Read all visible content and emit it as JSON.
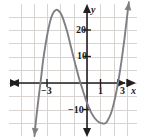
{
  "figure": {
    "kind": "cartesian-graph",
    "background": "#ffffff",
    "grid_color": "#d8d4d2",
    "axis_color": "#231f20",
    "curve_color": "#7f7f86"
  },
  "labels": {
    "y_axis_name": "y",
    "x_axis_name": "x",
    "y_tick_20": "20",
    "y_tick_10": "10",
    "y_tick_neg10": "−10",
    "x_tick_neg3": "−3",
    "x_tick_1": "1",
    "x_tick_3": "3"
  },
  "chart_data": {
    "type": "line",
    "title": "",
    "xlabel": "x",
    "ylabel": "y",
    "xlim": [
      -4.5,
      4.1
    ],
    "ylim": [
      -22,
      32
    ],
    "grid": true,
    "legend": null,
    "x_ticks": [
      -3,
      1,
      3
    ],
    "x_tick_labels": [
      "−3",
      "1",
      "3"
    ],
    "y_ticks": [
      -10,
      10,
      20
    ],
    "y_tick_labels": [
      "−10",
      "10",
      "20"
    ],
    "grid_step_x": 1,
    "grid_step_y": 5,
    "axis_arrows": [
      "left",
      "right",
      "up",
      "down"
    ],
    "series": [
      {
        "name": "cubic",
        "color": "#7f7f86",
        "x": [
          -3.95,
          -3.8,
          -3.6,
          -3.45,
          -3.3,
          -3.1,
          -2.9,
          -2.7,
          -2.5,
          -2.3,
          -2.2,
          -2.0,
          -1.8,
          -1.5,
          -1.2,
          -0.9,
          -0.6,
          -0.3,
          0.0,
          0.3,
          0.6,
          0.9,
          1.2,
          1.35,
          1.5,
          1.8,
          2.0,
          2.2,
          2.4,
          2.6,
          2.8,
          3.0,
          3.15
        ],
        "y": [
          -20.0,
          -12.5,
          -4.0,
          2.0,
          8.5,
          15.0,
          20.5,
          24.5,
          26.8,
          27.6,
          27.5,
          26.5,
          24.3,
          19.5,
          13.5,
          7.5,
          1.8,
          -3.0,
          -7.5,
          -11.0,
          -13.4,
          -14.8,
          -15.3,
          -15.2,
          -14.6,
          -11.5,
          -8.0,
          -3.5,
          2.0,
          8.5,
          16.0,
          24.5,
          30.5
        ]
      }
    ],
    "annotations": {
      "local_max": {
        "x": -2.2,
        "y": 27.5
      },
      "local_min": {
        "x": 1.3,
        "y": -15.3
      },
      "roots_approx": [
        -3.5,
        0.0,
        2.3
      ]
    }
  }
}
